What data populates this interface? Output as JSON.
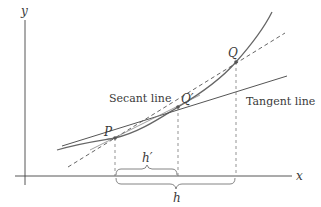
{
  "diagram": {
    "axes": {
      "x_label": "x",
      "y_label": "y"
    },
    "points": {
      "P": {
        "label": "P"
      },
      "Q_prime": {
        "label": "Q′"
      },
      "Q": {
        "label": "Q"
      }
    },
    "lines": {
      "secant_label": "Secant line",
      "tangent_label": "Tangent line"
    },
    "intervals": {
      "h_prime_label": "h′",
      "h_label": "h"
    },
    "colors": {
      "curve": "#666666",
      "lines": "#555555",
      "axes": "#444444",
      "text": "#3a3a3a",
      "background": "#ffffff"
    }
  }
}
